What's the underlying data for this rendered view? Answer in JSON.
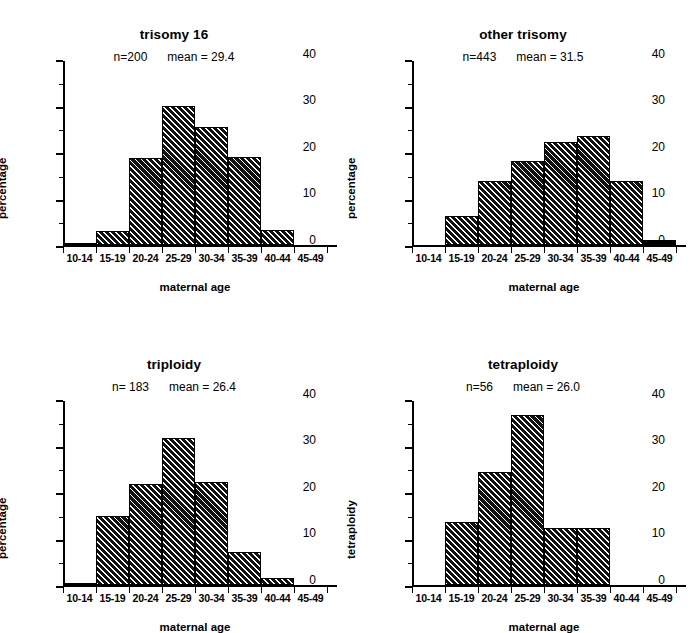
{
  "figure": {
    "background": "#ffffff",
    "ink": "#000000",
    "panel_count": 4
  },
  "chart_data": [
    {
      "type": "bar",
      "panel": "top-left",
      "title": "trisomy 16",
      "subtitle": "n=200      mean = 29.4",
      "n_label": "n=200",
      "mean_label": "mean = 29.4",
      "n": 200,
      "mean": 29.4,
      "xlabel": "maternal age",
      "ylabel": "percentage",
      "categories": [
        "10-14",
        "15-19",
        "20-24",
        "25-29",
        "30-34",
        "35-39",
        "40-44",
        "45-49"
      ],
      "values": [
        0.5,
        3.0,
        19.0,
        30.2,
        25.6,
        19.2,
        3.2,
        0
      ],
      "ylim": [
        0,
        40
      ],
      "yticks": [
        0,
        10,
        20,
        30,
        40
      ],
      "yminor": [
        5,
        15,
        25,
        35
      ],
      "grid": false,
      "legend": false
    },
    {
      "type": "bar",
      "panel": "top-right",
      "title": "other trisomy",
      "subtitle": "n=443      mean = 31.5",
      "n_label": "n=443",
      "mean_label": "mean = 31.5",
      "n": 443,
      "mean": 31.5,
      "xlabel": "maternal age",
      "ylabel": "percentage",
      "categories": [
        "10-14",
        "15-19",
        "20-24",
        "25-29",
        "30-34",
        "35-39",
        "40-44",
        "45-49"
      ],
      "values": [
        0,
        6.3,
        14.0,
        18.3,
        22.5,
        23.8,
        14.0,
        1.0
      ],
      "ylim": [
        0,
        40
      ],
      "yticks": [
        0,
        10,
        20,
        30,
        40
      ],
      "yminor": [
        5,
        15,
        25,
        35
      ],
      "grid": false,
      "legend": false
    },
    {
      "type": "bar",
      "panel": "bottom-left",
      "title": "triploidy",
      "subtitle": "n= 183      mean = 26.4",
      "n_label": "n= 183",
      "mean_label": "mean = 26.4",
      "n": 183,
      "mean": 26.4,
      "xlabel": "maternal age",
      "ylabel": "percentage",
      "categories": [
        "10-14",
        "15-19",
        "20-24",
        "25-29",
        "30-34",
        "35-39",
        "40-44",
        "45-49"
      ],
      "values": [
        0.5,
        14.9,
        21.9,
        31.9,
        22.5,
        7.2,
        1.6,
        0
      ],
      "ylim": [
        0,
        40
      ],
      "yticks": [
        0,
        10,
        20,
        30,
        40
      ],
      "yminor": [
        5,
        15,
        25,
        35
      ],
      "grid": false,
      "legend": false
    },
    {
      "type": "bar",
      "panel": "bottom-right",
      "title": "tetraploidy",
      "subtitle": "n=56      mean = 26.0",
      "n_label": "n=56",
      "mean_label": "mean = 26.0",
      "n": 56,
      "mean": 26.0,
      "xlabel": "maternal age",
      "ylabel": "tetraploidy",
      "categories": [
        "10-14",
        "15-19",
        "20-24",
        "25-29",
        "30-34",
        "35-39",
        "40-44",
        "45-49"
      ],
      "values": [
        0,
        13.8,
        24.5,
        37.0,
        12.3,
        12.3,
        0,
        0
      ],
      "ylim": [
        0,
        40
      ],
      "yticks": [
        0,
        10,
        20,
        30,
        40
      ],
      "yminor": [
        5,
        15,
        25,
        35
      ],
      "grid": false,
      "legend": false
    }
  ]
}
